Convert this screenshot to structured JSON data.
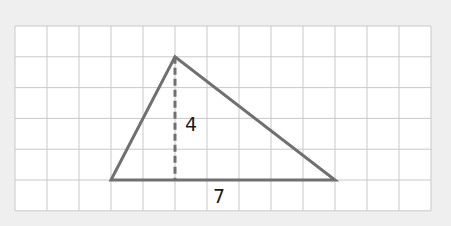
{
  "diagram": {
    "type": "triangle-on-grid",
    "grid": {
      "columns": 13,
      "rows": 6,
      "origin_x": 15,
      "origin_y": 26,
      "cell_w": 32.0,
      "cell_h": 30.8,
      "line_color": "#c9c9c9",
      "cell_fill": "#ffffff"
    },
    "triangle": {
      "vertices_grid": [
        [
          3,
          5
        ],
        [
          5,
          1
        ],
        [
          10,
          5
        ]
      ],
      "stroke": "#707070",
      "stroke_width": 3
    },
    "height_line": {
      "from_grid": [
        5,
        1
      ],
      "to_grid": [
        5,
        5
      ],
      "style": "dashed",
      "stroke": "#707070"
    },
    "labels": {
      "height": "4",
      "base": "7"
    },
    "background": "#efefef"
  }
}
